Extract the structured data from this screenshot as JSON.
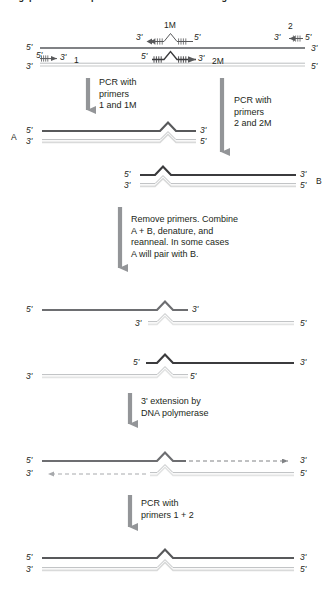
{
  "figure": {
    "title_fragment": "Megaprimer / overlap-extension site-directed mutagenesis",
    "colors": {
      "top_strand": "#6d6e71",
      "top_strand_dark": "#3b3b3d",
      "bottom_strand": "#d9dada",
      "bottom_strand_outline": "#bcbec0",
      "arrow_gray": "#939598",
      "text": "#231f20"
    }
  },
  "labels": {
    "five_prime": "5'",
    "three_prime": "3'",
    "primer_1": "1",
    "primer_2": "2",
    "primer_1M": "1M",
    "primer_2M": "2M",
    "fragment_A": "A",
    "fragment_B": "B"
  },
  "steps": [
    {
      "id": "pcr-1-1M",
      "text": "PCR with\nprimers\n1 and 1M"
    },
    {
      "id": "pcr-2-2M",
      "text": "PCR with\nprimers\n2 and 2M"
    },
    {
      "id": "combine",
      "text": "Remove primers. Combine\nA + B, denature, and\nreanneal. In some cases\nA will pair with B."
    },
    {
      "id": "extension",
      "text": "3' extension by\nDNA polymerase"
    },
    {
      "id": "pcr-1-2",
      "text": "PCR with\nprimers 1 + 2"
    }
  ],
  "panels": [
    {
      "id": "template-duplex",
      "name": "starting-template-duplex",
      "top_strand_end_labels": [
        "5'",
        "3'"
      ],
      "bottom_strand_end_labels": [
        "3'",
        "5'"
      ],
      "primers": [
        {
          "name": "1",
          "left_label": "5'",
          "right_label": "3'",
          "direction": "right",
          "on": "bottom"
        },
        {
          "name": "1M",
          "left_label": "3'",
          "right_label": "5'",
          "direction": "left",
          "on": "top"
        },
        {
          "name": "2M",
          "left_label": "5'",
          "right_label": "3'",
          "direction": "right",
          "on": "bottom"
        },
        {
          "name": "2",
          "left_label": "3'",
          "right_label": "5'",
          "direction": "left",
          "on": "top"
        }
      ]
    },
    {
      "id": "fragment-A",
      "name": "pcr-product-A",
      "tag": "A",
      "top_labels": [
        "5'",
        "3'"
      ],
      "bottom_labels": [
        "3'",
        "5'"
      ]
    },
    {
      "id": "fragment-B",
      "name": "pcr-product-B",
      "tag": "B",
      "top_labels": [
        "5'",
        "3'"
      ],
      "bottom_labels": [
        "3'",
        "5'"
      ]
    },
    {
      "id": "heteroduplex-1",
      "name": "reannealed-heteroduplex-one",
      "top_labels": [
        "5'",
        "3'"
      ],
      "bottom_labels": [
        "3'",
        "5'"
      ]
    },
    {
      "id": "heteroduplex-2",
      "name": "reannealed-heteroduplex-two",
      "top_labels": [
        "5'",
        "3'"
      ],
      "bottom_labels": [
        "3'",
        "5'"
      ]
    },
    {
      "id": "extended-duplex",
      "name": "extended-duplex",
      "top_labels": [
        "5'",
        "3'"
      ],
      "bottom_labels": [
        "3'",
        "5'"
      ],
      "extension_style": "dashed-arrow"
    },
    {
      "id": "final-duplex",
      "name": "final-mutant-duplex",
      "top_labels": [
        "5'",
        "3'"
      ],
      "bottom_labels": [
        "3'",
        "5'"
      ]
    }
  ]
}
